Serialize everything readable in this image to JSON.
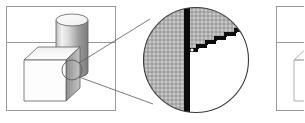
{
  "figure": {
    "width": 304,
    "height": 123,
    "background_color": "#ffffff"
  },
  "panels": [
    {
      "id": "panel-left",
      "name": "rendered-scene-panel",
      "label": "Rendered scene with cube and cylinder",
      "x": 6,
      "y": 6,
      "width": 110,
      "height": 105,
      "frame_color": "#9a9a9a",
      "divider_y": 42,
      "contents": {
        "cylinder": {
          "label": "cylinder",
          "cx": 72,
          "top_y": 14,
          "bottom_y": 72,
          "rx": 16,
          "ry": 6,
          "fill_light": "#fefefe",
          "fill_dark": "#8e8e8e"
        },
        "cube": {
          "label": "cube",
          "front_left_x": 24,
          "front_right_x": 66,
          "front_top_y": 60,
          "front_bottom_y": 101,
          "depth_x": 14,
          "depth_y": -13,
          "front_fill": "#fdfdfd",
          "top_fill": "#f4f4f4",
          "side_fill": "#a9a9a9"
        },
        "detail_circle": {
          "label": "region-of-interest marker",
          "cx": 72,
          "cy": 70,
          "r": 10
        }
      }
    },
    {
      "id": "panel-right",
      "name": "second-scene-panel",
      "label": "Second scene panel (clipped at right edge)",
      "x": 276,
      "y": 6,
      "width": 110,
      "height": 105,
      "frame_color": "#9a9a9a",
      "divider_y": 42,
      "contents": {
        "cube": {
          "label": "cube outline",
          "front_left_x": 294,
          "front_right_x": 336,
          "front_top_y": 60,
          "front_bottom_y": 101,
          "depth_x": 14,
          "depth_y": -13
        }
      }
    }
  ],
  "callout": {
    "name": "magnifier-callout",
    "label": "Magnified pixel view",
    "center_x": 196,
    "center_y": 60,
    "radius": 53,
    "ring_color": "#3b3b3b",
    "leader_lines": [
      {
        "x1": 79,
        "y1": 63,
        "x2": 149,
        "y2": 20
      },
      {
        "x1": 79,
        "y1": 77,
        "x2": 152,
        "y2": 104
      }
    ]
  },
  "pixel_grid": {
    "name": "pixel-grid",
    "label": "Pixel grid inside magnifier",
    "cell_size": 4,
    "origin_x": 144,
    "origin_y": 8,
    "columns": 26,
    "rows": 28,
    "line_color": "#6f6f6f",
    "fill_color": "#c8c8c8",
    "blank_color": "#ffffff"
  },
  "aliased_edge": {
    "name": "staircase-edge",
    "label": "Jagged staircase silhouette edge",
    "block_color": "#0b0b0b",
    "vertical_band": {
      "label": "vertical edge band",
      "x": 184,
      "y": 8,
      "width": 6,
      "height": 110
    },
    "steps": [
      {
        "x": 190,
        "y": 48,
        "width": 8,
        "height": 4
      },
      {
        "x": 198,
        "y": 44,
        "width": 9,
        "height": 4
      },
      {
        "x": 207,
        "y": 40,
        "width": 9,
        "height": 4
      },
      {
        "x": 216,
        "y": 36,
        "width": 10,
        "height": 4
      },
      {
        "x": 226,
        "y": 32,
        "width": 10,
        "height": 4
      },
      {
        "x": 236,
        "y": 28,
        "width": 8,
        "height": 4
      }
    ],
    "filled_region_note": "Grid cells above and left of the staircase are shaded; cells below and right are white"
  },
  "colors": {
    "frame": "#9a9a9a",
    "outline": "#4d4d4d",
    "shade_light": "#f4f4f4",
    "shade_mid": "#a9a9a9",
    "shade_dark": "#8e8e8e",
    "black": "#0b0b0b",
    "grid": "#6f6f6f"
  }
}
